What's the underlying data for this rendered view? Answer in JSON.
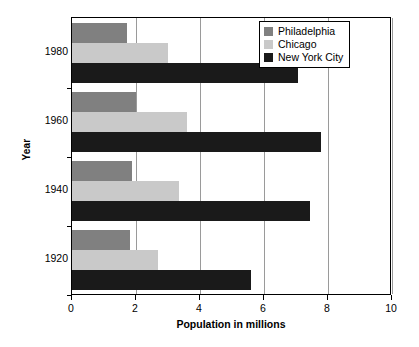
{
  "chart_data": {
    "type": "bar",
    "orientation": "horizontal",
    "title": "",
    "xlabel": "Population in millions",
    "ylabel": "Year",
    "categories": [
      "1980",
      "1960",
      "1940",
      "1920"
    ],
    "series": [
      {
        "name": "Philadelphia",
        "color": "#808080",
        "values": [
          1.72,
          2.0,
          1.88,
          1.82
        ]
      },
      {
        "name": "Chicago",
        "color": "#c9c9c9",
        "values": [
          3.0,
          3.59,
          3.35,
          2.7
        ]
      },
      {
        "name": "New York City",
        "color": "#1a1a1a",
        "values": [
          7.06,
          7.78,
          7.45,
          5.6
        ]
      }
    ],
    "xlim": [
      0,
      10
    ],
    "xticks": [
      0,
      2,
      4,
      6,
      8,
      10
    ],
    "xtick_labels": [
      "0",
      "2",
      "4",
      "6",
      "8",
      "10"
    ],
    "ytick_labels": [
      "1980",
      "1960",
      "1940",
      "1920"
    ],
    "grid": "vertical",
    "legend_position": "top-right",
    "legend_entries": [
      "Philadelphia",
      "Chicago",
      "New York City"
    ]
  },
  "axes": {
    "x_title": "Population in millions",
    "y_title": "Year"
  },
  "legend": {
    "items": [
      {
        "label": "Philadelphia",
        "color": "#808080",
        "icon": "legend-swatch-icon"
      },
      {
        "label": "Chicago",
        "color": "#c9c9c9",
        "icon": "legend-swatch-icon"
      },
      {
        "label": "New York City",
        "color": "#1a1a1a",
        "icon": "legend-swatch-icon"
      }
    ]
  }
}
